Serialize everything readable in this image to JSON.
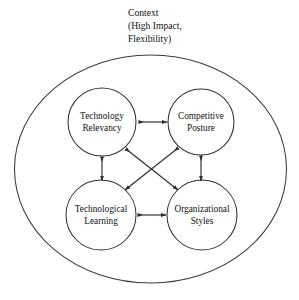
{
  "figure": {
    "boundary": {
      "name": "context-boundary",
      "shape": "ellipse",
      "label_lines": [
        "Context",
        "(High Impact,",
        "Flexibility)"
      ],
      "stroke_color": "#3a3a3a"
    },
    "nodes": [
      {
        "id": "technology-relevancy",
        "lines": [
          "Technology",
          "Relevancy"
        ],
        "position": "top-left",
        "cx": 102,
        "cy": 122,
        "r": 34
      },
      {
        "id": "competitive-posture",
        "lines": [
          "Competitive",
          "Posture"
        ],
        "position": "top-right",
        "cx": 201,
        "cy": 122,
        "r": 33
      },
      {
        "id": "technological-learning",
        "lines": [
          "Technological",
          "Learning"
        ],
        "position": "bottom-left",
        "cx": 101,
        "cy": 215,
        "r": 35
      },
      {
        "id": "organizational-styles",
        "lines": [
          "Organizational",
          "Styles"
        ],
        "position": "bottom-right",
        "cx": 202,
        "cy": 215,
        "r": 35
      }
    ],
    "connectors": [
      {
        "id": "tr-cp",
        "from": "technology-relevancy",
        "to": "competitive-posture",
        "style": "double-headed",
        "orientation": "horizontal-top"
      },
      {
        "id": "tl-os",
        "from": "technological-learning",
        "to": "organizational-styles",
        "style": "double-headed",
        "orientation": "horizontal-bottom"
      },
      {
        "id": "tr-tl",
        "from": "technology-relevancy",
        "to": "technological-learning",
        "style": "double-headed",
        "orientation": "vertical-left"
      },
      {
        "id": "cp-os",
        "from": "competitive-posture",
        "to": "organizational-styles",
        "style": "double-headed",
        "orientation": "vertical-right"
      },
      {
        "id": "tr-os",
        "from": "technology-relevancy",
        "to": "organizational-styles",
        "style": "double-headed",
        "orientation": "diagonal-down-right"
      },
      {
        "id": "cp-tl",
        "from": "competitive-posture",
        "to": "technological-learning",
        "style": "double-headed",
        "orientation": "diagonal-down-left"
      }
    ],
    "colors": {
      "background": "#ffffff",
      "stroke": "#333333",
      "text": "#111111"
    }
  }
}
